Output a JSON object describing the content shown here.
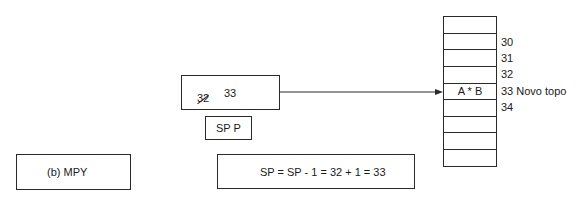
{
  "diagram": {
    "stack_pointer_box": {
      "old_value": "32",
      "new_value": "33"
    },
    "sp_label_box": {
      "label": "SP P"
    },
    "instruction_box": {
      "label": "(b) MPY"
    },
    "formula_box": {
      "text": "SP = SP - 1 = 32 + 1 = 33"
    },
    "stack": {
      "cells": [
        "",
        "",
        "",
        "",
        "A * B",
        "",
        "",
        "",
        ""
      ],
      "addresses": [
        {
          "label": "30",
          "y": 37
        },
        {
          "label": "31",
          "y": 53
        },
        {
          "label": "32",
          "y": 69
        },
        {
          "label": "33 Novo topo",
          "y": 86
        },
        {
          "label": "34",
          "y": 102
        }
      ]
    },
    "colors": {
      "line": "#2a2a2a",
      "background": "#ffffff"
    }
  }
}
